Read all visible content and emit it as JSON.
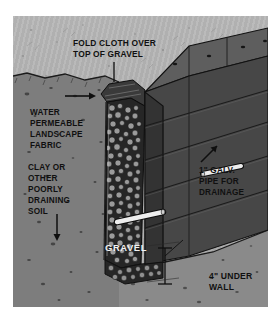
{
  "figure": {
    "palette": {
      "page_background": "#ffffff",
      "sky_background": "#b2b2b2",
      "soil": "#7d7d7d",
      "gravel_dark": "#2a2a2a",
      "gravel_stone": "#8d8d8d",
      "wall_block": "#4a4a4a",
      "wall_block_shadow": "#343434",
      "wall_top": "#5a5a5a",
      "pipe_white": "#f0f0f0",
      "label_text": "#101010",
      "label_text_light": "#f2f2f2",
      "outline": "#111111"
    },
    "labels": {
      "fold_cloth_line1": "FOLD CLOTH OVER",
      "fold_cloth_line2": "TOP OF GRAVEL",
      "water": "WATER",
      "permeable": "PERMEABLE",
      "landscape": "LANDSCAPE",
      "fabric": "FABRIC",
      "clay_or": "CLAY OR",
      "other": "OTHER",
      "poorly": "POORLY",
      "draining": "DRAINING",
      "soil": "SOIL",
      "gravel": "GRAVEL",
      "pipe_line1": "1\" GALV.",
      "pipe_line2": "PIPE FOR",
      "pipe_line3": "DRAINAGE",
      "under_line1": "4\" UNDER",
      "under_line2": "WALL"
    },
    "annotations": {
      "fold_cloth_leader": "vertical-leader-line",
      "water_arrow": "right-arrow",
      "soil_arrow": "down-arrow",
      "pipe_arrow": "up-right-arrow",
      "under_wall_dimension": "vertical-dimension-line"
    },
    "components": {
      "wall_courses": 5,
      "pipes": 2,
      "pipe_diameter": "1\"",
      "gravel_base_depth": "4\""
    }
  }
}
